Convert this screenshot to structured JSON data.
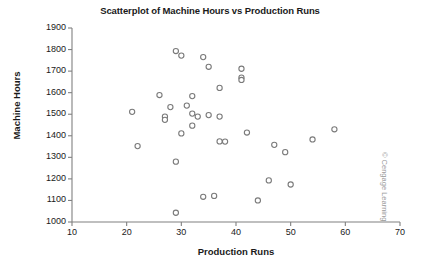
{
  "chart_data": {
    "type": "scatter",
    "title": "Scatterplot of Machine Hours vs Production Runs",
    "xlabel": "Production Runs",
    "ylabel": "Machine Hours",
    "xlim": [
      10,
      70
    ],
    "ylim": [
      1000,
      1900
    ],
    "xticks": [
      10,
      20,
      30,
      40,
      50,
      60,
      70
    ],
    "yticks": [
      1000,
      1100,
      1200,
      1300,
      1400,
      1500,
      1600,
      1700,
      1800,
      1900
    ],
    "xtick_labels": [
      "10",
      "20",
      "30",
      "40",
      "50",
      "60",
      "70"
    ],
    "ytick_labels": [
      "1000",
      "1100",
      "1200",
      "1300",
      "1400",
      "1500",
      "1600",
      "1700",
      "1800",
      "1900"
    ],
    "grid": false,
    "legend": null,
    "marker": {
      "shape": "circle-open",
      "edge_color": "#7a7a7a",
      "fill_color": "#ffffff",
      "size_px": 4
    },
    "axis_color": "#808080",
    "series": [
      {
        "name": "Machine Hours vs Production Runs",
        "points": [
          [
            21,
            1511
          ],
          [
            22,
            1352
          ],
          [
            26,
            1589
          ],
          [
            27,
            1489
          ],
          [
            27,
            1474
          ],
          [
            28,
            1533
          ],
          [
            29,
            1793
          ],
          [
            29,
            1280
          ],
          [
            29,
            1043
          ],
          [
            30,
            1772
          ],
          [
            30,
            1411
          ],
          [
            31,
            1540
          ],
          [
            32,
            1584
          ],
          [
            32,
            1503
          ],
          [
            32,
            1447
          ],
          [
            33,
            1489
          ],
          [
            34,
            1765
          ],
          [
            34,
            1117
          ],
          [
            35,
            1496
          ],
          [
            35,
            1720
          ],
          [
            36,
            1121
          ],
          [
            37,
            1622
          ],
          [
            37,
            1489
          ],
          [
            37,
            1374
          ],
          [
            38,
            1373
          ],
          [
            41,
            1711
          ],
          [
            41,
            1670
          ],
          [
            41,
            1659
          ],
          [
            42,
            1415
          ],
          [
            44,
            1100
          ],
          [
            46,
            1193
          ],
          [
            47,
            1358
          ],
          [
            49,
            1324
          ],
          [
            50,
            1174
          ],
          [
            54,
            1383
          ],
          [
            58,
            1430
          ]
        ]
      }
    ],
    "n_points": 36
  },
  "credit": {
    "text": "© Cengage Learning"
  }
}
